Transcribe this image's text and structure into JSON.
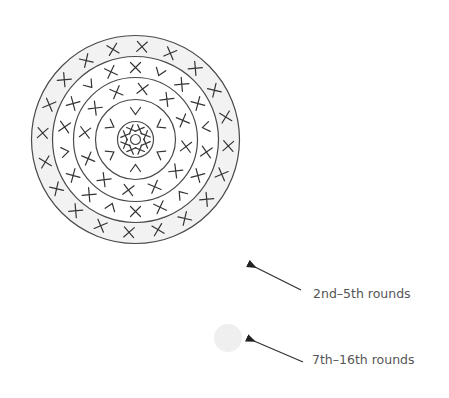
{
  "diagram": {
    "center": [
      135.5,
      139.5
    ],
    "colors": {
      "line": "#4a4a4a",
      "stitch": "#333333",
      "grey_fill": "#f2f2f2",
      "white_fill": "#ffffff"
    },
    "circles": [
      {
        "r": 104,
        "fill": "#f2f2f2"
      },
      {
        "r": 83,
        "fill": "#ffffff"
      },
      {
        "r": 62,
        "fill": "#ffffff"
      },
      {
        "r": 40,
        "fill": "#ffffff"
      },
      {
        "r": 18,
        "fill": "#ffffff"
      },
      {
        "r": 5,
        "fill": "#ffffff"
      }
    ],
    "rings": [
      {
        "name": "center-round",
        "radius": 11,
        "symbols": [
          "x",
          "x",
          "x",
          "x",
          "x",
          "x",
          "x",
          "x"
        ],
        "offset": 22
      },
      {
        "name": "round-2",
        "radius": 29,
        "symbols": [
          "v",
          "v",
          "v",
          "v",
          "v",
          "v"
        ],
        "offset": 0
      },
      {
        "name": "round-3",
        "radius": 51,
        "symbols": [
          "x",
          "x",
          "x",
          "x",
          "x",
          "x",
          "x",
          "x",
          "x",
          "x",
          "x",
          "x"
        ],
        "offset": 8
      },
      {
        "name": "round-4",
        "radius": 72,
        "symbols": [
          "x",
          "v",
          "x",
          "x",
          "v",
          "x",
          "x",
          "v",
          "x",
          "x",
          "v",
          "x",
          "x",
          "v",
          "x",
          "x",
          "v",
          "x"
        ],
        "offset": 0
      },
      {
        "name": "round-outer",
        "radius": 93,
        "symbols": [
          "x",
          "x",
          "x",
          "x",
          "x",
          "x",
          "x",
          "x",
          "x",
          "x",
          "x",
          "x",
          "x",
          "x",
          "x",
          "x",
          "x",
          "x",
          "x",
          "x"
        ],
        "offset": 4
      }
    ]
  },
  "legend": [
    {
      "label": "2nd–5th rounds",
      "swatch": "white",
      "swatch_fill": "#ffffff",
      "arrow_from": [
        301,
        290
      ],
      "arrow_to": [
        251,
        265
      ]
    },
    {
      "label": "7th–16th rounds",
      "swatch": "grey",
      "swatch_fill": "#efefef",
      "swatch_center": [
        228,
        338
      ],
      "swatch_r": 14,
      "arrow_from": [
        303,
        362
      ],
      "arrow_to": [
        250,
        339
      ]
    }
  ]
}
